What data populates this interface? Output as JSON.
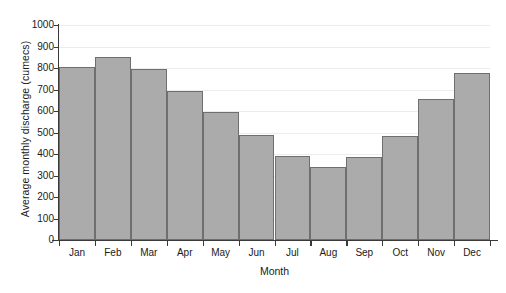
{
  "chart_data": {
    "type": "bar",
    "title": "",
    "xlabel": "Month",
    "ylabel": "Average monthly discharge (cumecs)",
    "categories": [
      "Jan",
      "Feb",
      "Mar",
      "Apr",
      "May",
      "Jun",
      "Jul",
      "Aug",
      "Sep",
      "Oct",
      "Nov",
      "Dec"
    ],
    "values": [
      805,
      850,
      795,
      695,
      595,
      490,
      390,
      340,
      385,
      485,
      655,
      775
    ],
    "ylim": [
      0,
      1000
    ],
    "ytick_labels": [
      "1000",
      "900",
      "800",
      "700",
      "600",
      "500",
      "400",
      "300",
      "200",
      "100",
      "0"
    ],
    "ytick_values": [
      1000,
      900,
      800,
      700,
      600,
      500,
      400,
      300,
      200,
      100,
      0
    ],
    "grid": true,
    "legend": false,
    "bar_fill_color": "#ababab",
    "bar_edge_color": "#6f6f6f",
    "axis_color": "#3a3a3a",
    "gridline_color": "#ececec",
    "background_color": "#ffffff"
  },
  "artifacts": {
    "top_faint_text": "",
    "bottom_faint_text": ""
  }
}
